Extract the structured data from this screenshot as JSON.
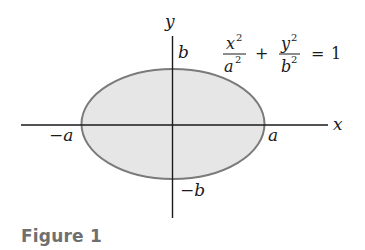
{
  "figure": {
    "caption": "Figure 1",
    "equation": {
      "term1_num": "x",
      "term1_num_exp": "2",
      "term1_den": "a",
      "term1_den_exp": "2",
      "plus": "+",
      "term2_num": "y",
      "term2_num_exp": "2",
      "term2_den": "b",
      "term2_den_exp": "2",
      "equals": "=",
      "rhs": "1"
    },
    "axes": {
      "x_label": "x",
      "y_label": "y"
    },
    "intercepts": {
      "pos_a": "a",
      "neg_a": "−a",
      "pos_b": "b",
      "neg_b": "−b"
    },
    "colors": {
      "ellipse_fill": "#e6e6e6",
      "ellipse_stroke": "#7a7a7a",
      "axis": "#1a1a1a",
      "caption": "#6f6f6f"
    }
  }
}
